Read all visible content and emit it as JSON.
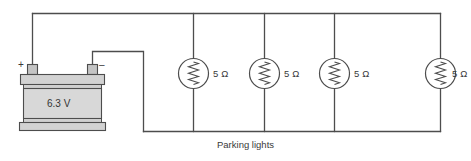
{
  "diagram": {
    "title_caption": "Parking lights",
    "background_color": "#ffffff",
    "line_color": "#4d4d4d",
    "battery": {
      "voltage_label": "6.3 V",
      "positive_sign": "+",
      "negative_sign": "–",
      "body_color": "#d8d8d8",
      "cap_color": "#d2d2d2",
      "terminal_color": "#c4c4c4"
    },
    "lamps": [
      {
        "id": "lamp-1",
        "resistance_label": "5 Ω"
      },
      {
        "id": "lamp-2",
        "resistance_label": "5 Ω"
      },
      {
        "id": "lamp-3",
        "resistance_label": "5 Ω"
      },
      {
        "id": "lamp-4",
        "resistance_label": "5 Ω"
      }
    ]
  }
}
